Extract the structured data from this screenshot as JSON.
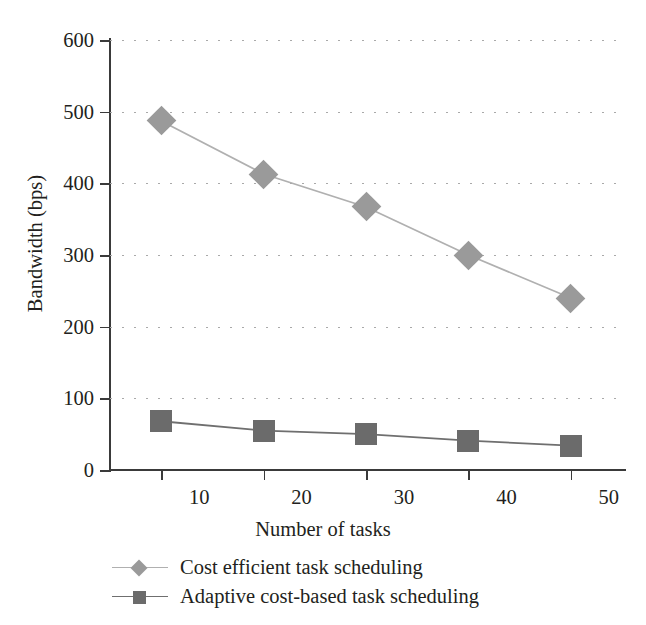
{
  "chart_data": {
    "type": "line",
    "title": "",
    "xlabel": "Number of tasks",
    "ylabel": "Bandwidth (bps)",
    "x": [
      10,
      20,
      30,
      40,
      50
    ],
    "categories": [
      "10",
      "20",
      "30",
      "40",
      "50"
    ],
    "xlim": [
      5,
      55
    ],
    "ylim": [
      0,
      600
    ],
    "y_ticks": [
      0,
      100,
      200,
      300,
      400,
      500,
      600
    ],
    "y_tick_labels": [
      "0",
      "100",
      "200",
      "300",
      "400",
      "500",
      "600"
    ],
    "x_tick_labels": [
      "10",
      "20",
      "30",
      "40",
      "50"
    ],
    "grid": "horizontal-dotted",
    "legend_position": "below-axis-left",
    "series": [
      {
        "name": "Cost efficient task scheduling",
        "marker": "diamond",
        "color": "#9a9a9a",
        "line_color": "#b0b0b0",
        "values": [
          487,
          413,
          367,
          300,
          240
        ]
      },
      {
        "name": "Adaptive cost-based task scheduling",
        "marker": "square",
        "color": "#6b6b6b",
        "line_color": "#6f6f6f",
        "values": [
          68,
          55,
          50,
          41,
          34
        ]
      }
    ]
  },
  "axes": {
    "y_title": "Bandwidth (bps)",
    "x_title": "Number of tasks",
    "y_labels": [
      "600",
      "500",
      "400",
      "300",
      "200",
      "100",
      "0"
    ],
    "x_labels": [
      "10",
      "20",
      "30",
      "40",
      "50"
    ]
  },
  "legend": {
    "items": [
      {
        "label": "Cost efficient task scheduling",
        "marker": "diamond-marker"
      },
      {
        "label": "Adaptive cost-based task scheduling",
        "marker": "square-marker"
      }
    ]
  },
  "colors": {
    "axis": "#3a3a3a",
    "grid": "#a9a9a9",
    "series1": "#9a9a9a",
    "series2": "#6b6b6b",
    "text": "#231f20",
    "background": "#ffffff"
  }
}
